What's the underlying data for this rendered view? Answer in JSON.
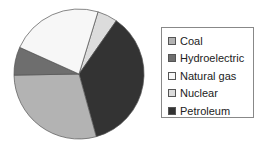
{
  "chart_data": {
    "type": "pie",
    "title": "",
    "categories": [
      "Coal",
      "Hydroelectric",
      "Natural gas",
      "Nuclear",
      "Petroleum"
    ],
    "values": [
      29,
      7,
      23,
      5,
      36
    ],
    "colors": [
      "#b3b3b3",
      "#6e6e6e",
      "#f7f7f7",
      "#dcdcdc",
      "#333333"
    ],
    "legend_position": "right",
    "start_angles_deg_clockwise_from_top": {
      "Nuclear": 17,
      "Petroleum": 34,
      "Coal": 162,
      "Hydroelectric": 268,
      "Natural gas": 293
    }
  },
  "legend": {
    "items": [
      {
        "label": "Coal",
        "color": "#b3b3b3"
      },
      {
        "label": "Hydroelectric",
        "color": "#6e6e6e"
      },
      {
        "label": "Natural gas",
        "color": "#f7f7f7"
      },
      {
        "label": "Nuclear",
        "color": "#dcdcdc"
      },
      {
        "label": "Petroleum",
        "color": "#333333"
      }
    ]
  }
}
